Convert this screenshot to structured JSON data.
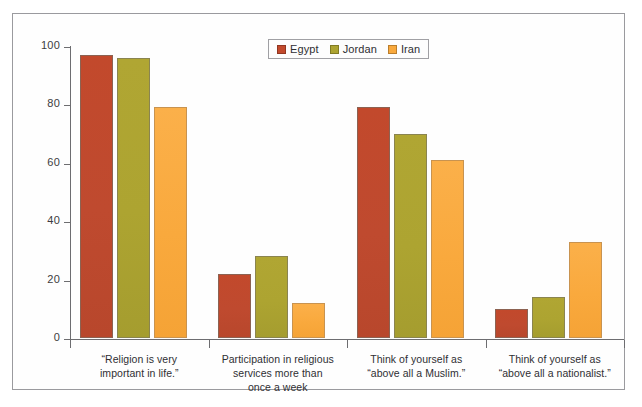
{
  "chart_data": {
    "type": "bar",
    "title": "",
    "subtitle": "",
    "xlabel": "",
    "ylabel": "",
    "ylim": [
      0,
      100
    ],
    "yticks": [
      0,
      20,
      40,
      60,
      80,
      100
    ],
    "grid": false,
    "legend_position": "top-center",
    "categories": [
      "“Religion is very\nimportant in life.”",
      "Participation in religious\nservices more than\nonce a week",
      "Think of yourself as\n“above all a Muslim.”",
      "Think of yourself as\n“above all a nationalist.”"
    ],
    "series": [
      {
        "name": "Egypt",
        "color": "#c2492c",
        "values": [
          97,
          22,
          79,
          10
        ]
      },
      {
        "name": "Jordan",
        "color": "#ada431",
        "values": [
          96,
          28,
          70,
          14
        ]
      },
      {
        "name": "Iran",
        "color": "#f9a93d",
        "values": [
          79,
          12,
          61,
          33
        ]
      }
    ]
  },
  "legend": {
    "items": [
      {
        "label": "Egypt",
        "color": "#c2492c"
      },
      {
        "label": "Jordan",
        "color": "#ada431"
      },
      {
        "label": "Iran",
        "color": "#f9a93d"
      }
    ]
  },
  "axis": {
    "y_tick_labels": [
      "100",
      "80",
      "60",
      "40",
      "20",
      "0"
    ]
  }
}
